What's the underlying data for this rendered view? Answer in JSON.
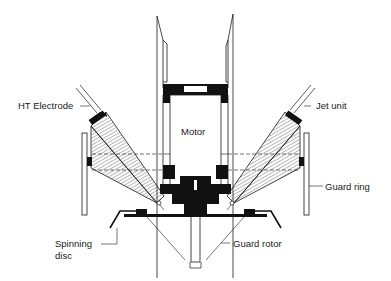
{
  "diagram": {
    "type": "technical-cross-section",
    "colors": {
      "line": "#1a1a1a",
      "fill": "#111111",
      "background": "#ffffff",
      "hatch": "#333333"
    },
    "labels": {
      "ht_electrode": "HT Electrode",
      "motor": "Motor",
      "jet_unit": "Jet unit",
      "guard_ring": "Guard ring",
      "spinning_disc_line1": "Spinning",
      "spinning_disc_line2": "disc",
      "guard_rotor": "Guard rotor"
    }
  }
}
